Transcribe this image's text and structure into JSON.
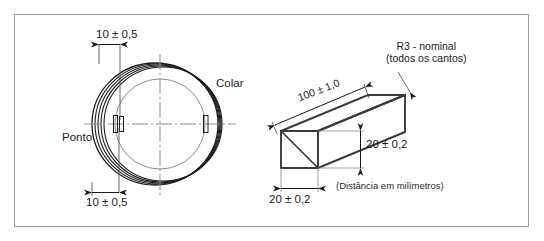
{
  "figure": {
    "border_color": "#9a9a9a",
    "line_color": "#1a1a1a",
    "thin_line_color": "#777777",
    "centerline_color": "#888888",
    "background": "#ffffff"
  },
  "left_view": {
    "name": "vista-circular-colar",
    "dimension_top": "10 ± 0,5",
    "dimension_bottom": "10 ± 0,5",
    "callout_collar": "Colar",
    "callout_point": "Ponto"
  },
  "right_view": {
    "name": "vista-isometrica-barra",
    "callout_radius_line1": "R3 - nominal",
    "callout_radius_line2": "(todos os cantos)",
    "dimension_length": "100 ± 1,0",
    "dimension_height": "20 ± 0,2",
    "dimension_width": "20 ± 0,2",
    "note_units": "(Distância em milímetros)"
  }
}
